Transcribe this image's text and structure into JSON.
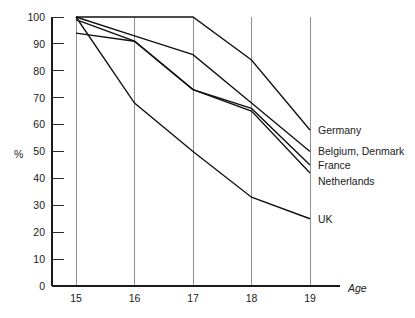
{
  "chart_data": {
    "type": "line",
    "title": "",
    "subtitle": "",
    "xlabel": "Age",
    "ylabel": "%",
    "x": [
      15,
      16,
      17,
      18,
      19
    ],
    "xtick_labels": [
      "15",
      "16",
      "17",
      "18",
      "19"
    ],
    "ytick_labels": [
      "0",
      "10",
      "20",
      "30",
      "40",
      "50",
      "60",
      "70",
      "80",
      "90",
      "100"
    ],
    "ytick_values": [
      0,
      10,
      20,
      30,
      40,
      50,
      60,
      70,
      80,
      90,
      100
    ],
    "xlim": [
      15,
      19
    ],
    "ylim": [
      0,
      100
    ],
    "grid": "vertical-only",
    "legend_position": "right-inline",
    "series": [
      {
        "name": "Germany",
        "values": [
          100,
          100,
          100,
          84,
          58
        ]
      },
      {
        "name": "Belgium, Denmark",
        "values": [
          100,
          93,
          86,
          68,
          50
        ]
      },
      {
        "name": "France",
        "values": [
          99,
          91,
          73,
          66,
          45
        ]
      },
      {
        "name": "Netherlands",
        "values": [
          94,
          91,
          73,
          65,
          42
        ]
      },
      {
        "name": "UK",
        "values": [
          100,
          68,
          50,
          33,
          25
        ]
      }
    ],
    "series_label_y": [
      58,
      50,
      45,
      39,
      25
    ],
    "line_color": "#111111",
    "grid_color": "#8f8f8f",
    "axis_color": "#1a1a1a"
  }
}
